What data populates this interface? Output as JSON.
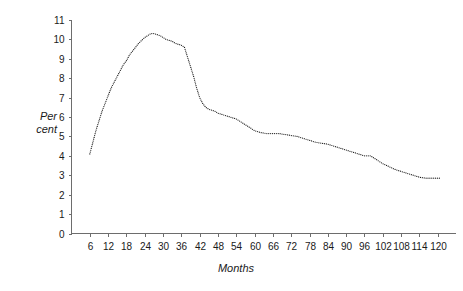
{
  "chart_data": {
    "type": "line",
    "title": "",
    "subtitle": "",
    "xlabel": "Months",
    "ylabel": "Per cent",
    "ylabel_line1": "Per",
    "ylabel_line2": "cent",
    "xlim": [
      0,
      126
    ],
    "ylim": [
      0,
      11
    ],
    "grid": false,
    "legend": null,
    "line_style": "dotted",
    "line_color": "#1c1c1c",
    "axis_color": "#6d6d6d",
    "background": "#ffffff",
    "xticks": [
      6,
      12,
      18,
      24,
      30,
      36,
      42,
      48,
      54,
      60,
      66,
      72,
      78,
      84,
      90,
      96,
      102,
      108,
      114,
      120
    ],
    "xtick_labels": [
      "6",
      "12",
      "18",
      "24",
      "30",
      "36",
      "42",
      "48",
      "54",
      "60",
      "66",
      "72",
      "78",
      "84",
      "90",
      "96",
      "102",
      "108",
      "114",
      "120"
    ],
    "yticks": [
      0,
      1,
      2,
      3,
      4,
      5,
      6,
      7,
      8,
      9,
      10,
      11
    ],
    "ytick_labels": [
      "0",
      "1",
      "2",
      "3",
      "4",
      "5",
      "6",
      "7",
      "8",
      "9",
      "10",
      "11"
    ],
    "series": [
      {
        "name": "Per cent",
        "x": [
          6,
          7,
          8,
          9,
          10,
          11,
          12,
          13,
          14,
          15,
          16,
          17,
          18,
          19,
          20,
          21,
          22,
          23,
          24,
          25,
          26,
          27,
          28,
          29,
          30,
          31,
          32,
          33,
          34,
          35,
          36,
          37,
          38,
          39,
          40,
          41,
          42,
          43,
          44,
          45,
          46,
          47,
          48,
          50,
          52,
          54,
          56,
          58,
          60,
          62,
          64,
          66,
          68,
          70,
          72,
          74,
          76,
          78,
          80,
          82,
          84,
          86,
          88,
          90,
          92,
          94,
          96,
          98,
          100,
          102,
          104,
          106,
          108,
          110,
          112,
          114,
          116,
          118,
          120,
          121
        ],
        "values": [
          4.1,
          4.7,
          5.3,
          5.8,
          6.3,
          6.7,
          7.1,
          7.5,
          7.8,
          8.1,
          8.4,
          8.7,
          8.9,
          9.2,
          9.4,
          9.6,
          9.8,
          9.95,
          10.1,
          10.2,
          10.3,
          10.3,
          10.25,
          10.2,
          10.1,
          10.0,
          9.95,
          9.9,
          9.8,
          9.75,
          9.7,
          9.6,
          9.1,
          8.6,
          8.1,
          7.5,
          7.0,
          6.7,
          6.5,
          6.4,
          6.35,
          6.3,
          6.2,
          6.1,
          6.0,
          5.9,
          5.7,
          5.5,
          5.3,
          5.2,
          5.15,
          5.15,
          5.15,
          5.1,
          5.05,
          5.0,
          4.9,
          4.8,
          4.7,
          4.65,
          4.6,
          4.5,
          4.4,
          4.3,
          4.2,
          4.1,
          4.0,
          4.0,
          3.8,
          3.6,
          3.45,
          3.3,
          3.2,
          3.1,
          3.0,
          2.9,
          2.85,
          2.85,
          2.85,
          2.85
        ]
      }
    ],
    "annotations": []
  },
  "page": {
    "axis_title_x": "Months",
    "axis_title_y_line1": "Per",
    "axis_title_y_line2": "cent"
  }
}
